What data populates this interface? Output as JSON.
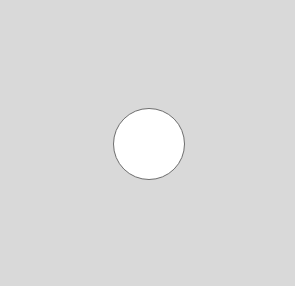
{
  "panel": {
    "background_color": "#d9d9d9"
  },
  "circle": {
    "shape": "circle",
    "fill_color": "#ffffff",
    "outline_color": "#6e6e6e"
  }
}
